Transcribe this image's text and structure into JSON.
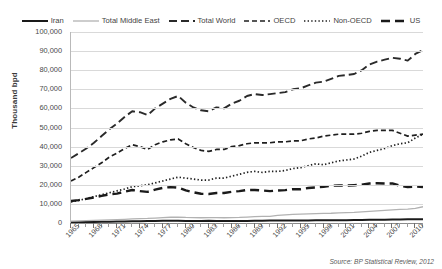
{
  "chart_data": {
    "type": "line",
    "title": "",
    "xlabel": "",
    "ylabel": "Thousand bpd",
    "ylim": [
      0,
      100000
    ],
    "xlim": [
      1965,
      2011
    ],
    "grid": true,
    "legend_position": "top",
    "ytick_labels": [
      "100,000",
      "90,000",
      "80,000",
      "70,000",
      "60,000",
      "50,000",
      "40,000",
      "30,000",
      "20,000",
      "10,000",
      "0"
    ],
    "ytick_values": [
      100000,
      90000,
      80000,
      70000,
      60000,
      50000,
      40000,
      30000,
      20000,
      10000,
      0
    ],
    "xtick_labels": [
      "1965",
      "1968",
      "1971",
      "1974",
      "1977",
      "1980",
      "1983",
      "1986",
      "1989",
      "1992",
      "1995",
      "1998",
      "2001",
      "2004",
      "2007",
      "2010"
    ],
    "xtick_values": [
      1965,
      1968,
      1971,
      1974,
      1977,
      1980,
      1983,
      1986,
      1989,
      1992,
      1995,
      1998,
      2001,
      2004,
      2007,
      2010
    ],
    "x": [
      1965,
      1966,
      1967,
      1968,
      1969,
      1970,
      1971,
      1972,
      1973,
      1974,
      1975,
      1976,
      1977,
      1978,
      1979,
      1980,
      1981,
      1982,
      1983,
      1984,
      1985,
      1986,
      1987,
      1988,
      1989,
      1990,
      1991,
      1992,
      1993,
      1994,
      1995,
      1996,
      1997,
      1998,
      1999,
      2000,
      2001,
      2002,
      2003,
      2004,
      2005,
      2006,
      2007,
      2008,
      2009,
      2010,
      2011
    ],
    "series": [
      {
        "name": "Iran",
        "style": "solid-thick",
        "color": "#1a1a1a",
        "values": [
          400,
          450,
          500,
          560,
          610,
          660,
          720,
          790,
          860,
          930,
          1000,
          1080,
          1150,
          1230,
          1200,
          1050,
          1000,
          1050,
          1150,
          1050,
          1050,
          1000,
          1050,
          1100,
          1150,
          1200,
          1250,
          1300,
          1250,
          1250,
          1300,
          1330,
          1380,
          1400,
          1430,
          1460,
          1500,
          1550,
          1600,
          1650,
          1700,
          1750,
          1800,
          1850,
          1900,
          1950,
          2000
        ]
      },
      {
        "name": "Total Middle East",
        "style": "solid-light",
        "color": "#b2b2b2",
        "values": [
          1000,
          1100,
          1200,
          1350,
          1500,
          1650,
          1800,
          1950,
          2150,
          2300,
          2400,
          2600,
          2800,
          3000,
          3100,
          2900,
          2800,
          2750,
          2800,
          2800,
          2750,
          2800,
          2900,
          3100,
          3300,
          3500,
          3500,
          4000,
          4300,
          4500,
          4600,
          4750,
          4900,
          5050,
          5100,
          5300,
          5450,
          5550,
          5800,
          6100,
          6350,
          6600,
          6850,
          7100,
          7300,
          7700,
          8500
        ]
      },
      {
        "name": "Total World",
        "style": "longdash-marker",
        "color": "#2a2a2a",
        "values": [
          34000,
          36500,
          39000,
          42000,
          45500,
          49000,
          52000,
          55500,
          58500,
          58000,
          56500,
          60000,
          62500,
          65000,
          66500,
          63000,
          60500,
          59000,
          58500,
          60500,
          60000,
          62500,
          64000,
          66500,
          67500,
          67000,
          67500,
          68000,
          68500,
          70000,
          70500,
          72000,
          73500,
          74000,
          75500,
          77000,
          77500,
          78000,
          80000,
          83000,
          84500,
          85500,
          86500,
          86000,
          85000,
          88500,
          90500
        ]
      },
      {
        "name": "OECD",
        "style": "dash",
        "color": "#1f1f1f",
        "values": [
          22000,
          24000,
          26500,
          29000,
          31500,
          34500,
          36500,
          39000,
          41000,
          40000,
          38500,
          41000,
          42500,
          43500,
          44000,
          41500,
          39500,
          38000,
          37500,
          38500,
          38500,
          40000,
          40500,
          41500,
          42000,
          42000,
          42000,
          42500,
          42500,
          43000,
          43000,
          44000,
          44500,
          45500,
          46000,
          46500,
          46500,
          46500,
          47000,
          48000,
          48500,
          48500,
          48500,
          47000,
          45500,
          46000,
          46500
        ]
      },
      {
        "name": "Non-OECD",
        "style": "dot",
        "color": "#1f1f1f",
        "values": [
          11000,
          11800,
          12800,
          13800,
          14800,
          15800,
          16800,
          17800,
          19000,
          19500,
          20000,
          21000,
          22000,
          23000,
          24000,
          23500,
          23000,
          22500,
          22500,
          23500,
          23500,
          24500,
          25500,
          26500,
          27000,
          26500,
          27000,
          27000,
          27500,
          28500,
          29000,
          30000,
          31000,
          30500,
          31500,
          32500,
          33000,
          33500,
          35000,
          37000,
          38000,
          39000,
          40500,
          41500,
          42000,
          44500,
          46500
        ]
      },
      {
        "name": "US",
        "style": "thickdash-marker",
        "color": "#1a1a1a",
        "values": [
          11500,
          12000,
          12600,
          13400,
          14200,
          15000,
          15400,
          16400,
          17300,
          16700,
          16300,
          17500,
          18400,
          18800,
          18500,
          17100,
          16100,
          15300,
          15200,
          15700,
          15700,
          16300,
          16700,
          17300,
          17300,
          17000,
          16700,
          17000,
          17200,
          17700,
          17700,
          18300,
          18600,
          18900,
          19500,
          19700,
          19600,
          19800,
          20000,
          20700,
          20800,
          20700,
          20700,
          19500,
          18800,
          19100,
          18800
        ]
      }
    ]
  },
  "legend": {
    "items": [
      {
        "label": "Iran",
        "style": "solid-thick"
      },
      {
        "label": "Total Middle East",
        "style": "solid-light"
      },
      {
        "label": "Total World",
        "style": "longdash-marker"
      },
      {
        "label": "OECD",
        "style": "dash"
      },
      {
        "label": "Non-OECD",
        "style": "dot"
      },
      {
        "label": "US",
        "style": "thickdash-marker"
      }
    ]
  },
  "source": {
    "text": "Source: BP Statistical Review, 2012"
  }
}
